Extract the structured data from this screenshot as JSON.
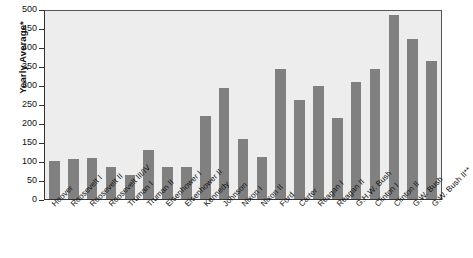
{
  "chart_data": {
    "type": "bar",
    "title": "",
    "subtitle": "",
    "xlabel": "",
    "ylabel": "Yearly Average*",
    "ylim": [
      0,
      500
    ],
    "yticks": [
      0,
      50,
      100,
      150,
      200,
      250,
      300,
      350,
      400,
      450,
      500
    ],
    "grid": false,
    "legend": "none",
    "bar_color": "#808080",
    "plot_background": "#ededed",
    "categories": [
      "Hoover",
      "Roosevelt I",
      "Roosevelt II",
      "Roosevelt III/IV",
      "Truman I",
      "Truman II",
      "Eisenhower I",
      "Eisenhower II",
      "Kennedy",
      "Johnson",
      "Nixon I",
      "Nixon II",
      "Ford",
      "Carter",
      "Reagan I",
      "Reagan II",
      "G.H.W. Bush",
      "Clinton I",
      "Clinton II",
      "G.W. Bush",
      "G.W. Bush II**"
    ],
    "values": [
      100,
      105,
      108,
      84,
      62,
      129,
      83,
      85,
      218,
      291,
      158,
      111,
      343,
      261,
      298,
      212,
      309,
      342,
      485,
      422,
      362
    ]
  }
}
